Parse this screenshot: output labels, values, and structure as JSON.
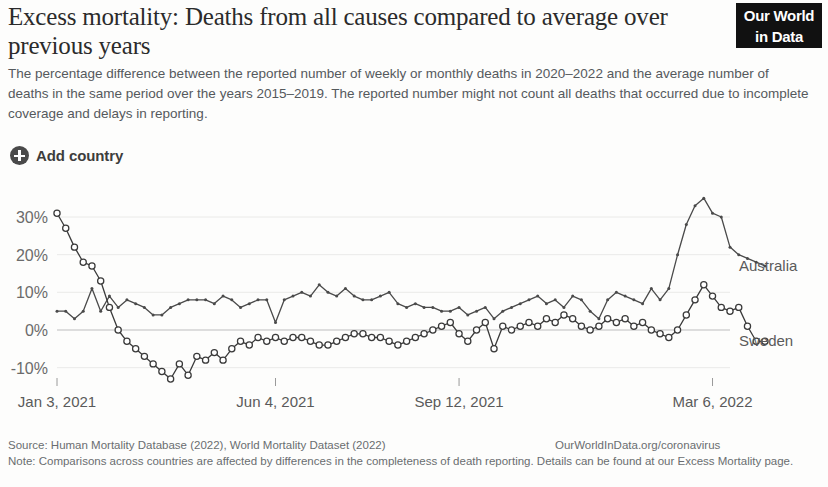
{
  "header": {
    "title": "Excess mortality: Deaths from all causes compared to average over previous years",
    "subtitle": "The percentage difference between the reported number of weekly or monthly deaths in 2020–2022 and the average number of deaths in the same period over the years 2015–2019. The reported number might not count all deaths that occurred due to incomplete coverage and delays in reporting.",
    "logo_line1": "Our World",
    "logo_line2": "in Data"
  },
  "controls": {
    "add_country_label": "Add country",
    "add_country_icon": "plus-circle-icon"
  },
  "footer": {
    "source": "Source: Human Mortality Database (2022), World Mortality Dataset (2022)",
    "url": "OurWorldInData.org/coronavirus",
    "note": "Note: Comparisons across countries are affected by differences in the completeness of death reporting. Details can be found at our Excess Mortality page."
  },
  "chart_data": {
    "type": "line",
    "title": "Excess mortality: Deaths from all causes compared to average over previous years",
    "xlabel": "",
    "ylabel": "",
    "ylim": [
      -15,
      36
    ],
    "yticks": [
      30,
      20,
      10,
      0,
      -10
    ],
    "ytick_labels": [
      "30%",
      "20%",
      "10%",
      "0%",
      "-10%"
    ],
    "xticks": [
      0,
      25,
      46,
      75
    ],
    "xtick_labels": [
      "Jan 3, 2021",
      "Jun 4, 2021",
      "Sep 12, 2021",
      "Mar 6, 2022"
    ],
    "grid": true,
    "zero_line": true,
    "legend_position": "right-inline",
    "x_count": 78,
    "series": [
      {
        "name": "Australia",
        "color": "#4a4a4a",
        "marker": "dot",
        "label_y_value": 17,
        "values": [
          5,
          5,
          3,
          5,
          11,
          5,
          9,
          6,
          8,
          7,
          6,
          4,
          4,
          6,
          7,
          8,
          8,
          8,
          7,
          9,
          8,
          6,
          7,
          8,
          8,
          2,
          8,
          9,
          10,
          9,
          12,
          10,
          9,
          11,
          9,
          8,
          8,
          9,
          10,
          7,
          6,
          7,
          6,
          6,
          5,
          5,
          6,
          4,
          5,
          6,
          3,
          5,
          6,
          7,
          8,
          9,
          7,
          8,
          6,
          9,
          8,
          5,
          3,
          8,
          10,
          9,
          8,
          7,
          11,
          8,
          11,
          20,
          28,
          33,
          35,
          31,
          30,
          22,
          20,
          19,
          18,
          17
        ]
      },
      {
        "name": "Sweden",
        "color": "#3a3a3a",
        "marker": "circle",
        "label_y_value": -3,
        "values": [
          31,
          27,
          22,
          18,
          17,
          13,
          6,
          0,
          -3,
          -5,
          -7,
          -9,
          -11,
          -13,
          -9,
          -12,
          -7,
          -8,
          -6,
          -8,
          -5,
          -3,
          -4,
          -2,
          -3,
          -2,
          -3,
          -2,
          -2,
          -3,
          -4,
          -4,
          -3,
          -2,
          -1,
          -1,
          -2,
          -2,
          -3,
          -4,
          -3,
          -2,
          -1,
          0,
          1,
          2,
          -1,
          -3,
          0,
          2,
          -5,
          1,
          0,
          1,
          2,
          1,
          3,
          2,
          4,
          3,
          1,
          0,
          1,
          3,
          2,
          3,
          1,
          2,
          0,
          -1,
          -2,
          0,
          4,
          8,
          12,
          9,
          6,
          5,
          6,
          1,
          -3,
          -3
        ]
      }
    ]
  }
}
